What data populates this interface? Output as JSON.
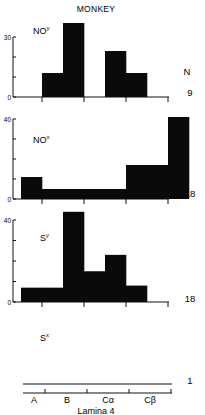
{
  "figure": {
    "title": "MONKEY",
    "n_header": "N",
    "x_title": "Lamina 4",
    "x_categories": [
      "A",
      "B",
      "Cα",
      "Cβ"
    ]
  },
  "chart_data": {
    "type": "bar",
    "title": "MONKEY",
    "xlabel": "Lamina 4",
    "ylabel": "",
    "x_categories": [
      "A",
      "B",
      "Cα",
      "Cβ"
    ],
    "bin_edges_note": "Each lamina sublayer split into two half-bins; 8 histogram bins spanning A..Cβ",
    "bins": [
      "A-lower",
      "A-upper/B-start",
      "B",
      "B-upper",
      "Cα-lower",
      "Cα-upper",
      "Cβ-lower",
      "Cβ-upper"
    ],
    "panels": [
      {
        "name": "NOy",
        "label_main": "NO",
        "label_sup": "y",
        "N": "9",
        "ylim": [
          0,
          30
        ],
        "yticks": [
          0,
          10,
          20,
          30
        ],
        "ytick_labels": [
          "0",
          "",
          "",
          "30"
        ],
        "values": [
          0,
          12,
          37,
          0,
          23,
          12,
          0,
          0
        ]
      },
      {
        "name": "NOx",
        "label_main": "NO",
        "label_sup": "x",
        "N": "18",
        "ylim": [
          0,
          40
        ],
        "yticks": [
          0,
          10,
          20,
          30,
          40
        ],
        "ytick_labels": [
          "0",
          "",
          "",
          "",
          "40"
        ],
        "values": [
          11,
          5,
          5,
          5,
          5,
          17,
          17,
          41
        ]
      },
      {
        "name": "Sy",
        "label_main": "S",
        "label_sup": "y",
        "N": "18",
        "ylim": [
          0,
          40
        ],
        "yticks": [
          0,
          10,
          20,
          30,
          40
        ],
        "ytick_labels": [
          "0",
          "",
          "",
          "",
          "40"
        ],
        "values": [
          7,
          7,
          44,
          15,
          23,
          8,
          0,
          0
        ]
      },
      {
        "name": "Sx",
        "label_main": "S",
        "label_sup": "x",
        "N": "1",
        "ylim": null,
        "yticks": [],
        "ytick_labels": [],
        "values": [
          0,
          0,
          0,
          0,
          0,
          0,
          0,
          0
        ]
      }
    ]
  }
}
